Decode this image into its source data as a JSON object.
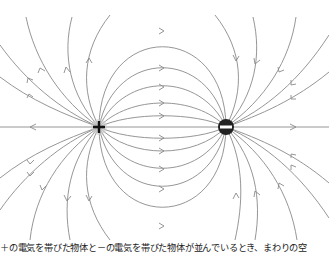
{
  "diagram": {
    "positive_charge": {
      "label": "+",
      "x": 99,
      "y": 127,
      "color": "#111111"
    },
    "negative_charge": {
      "label": "−",
      "x": 226,
      "y": 127,
      "color": "#222222"
    },
    "field_line_color": "#8a8a8a"
  },
  "caption": {
    "text": "＋の電気を帯びた物体と－の電気を帯びた物体が並んでいるとき、まわりの空"
  }
}
